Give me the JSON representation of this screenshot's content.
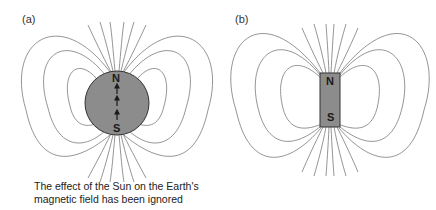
{
  "panels": [
    {
      "label": "(a)",
      "subject": "Earth",
      "north_label": "N",
      "south_label": "S",
      "shape": "circle",
      "fill_color": "#8c8c8c",
      "arrows": 3
    },
    {
      "label": "(b)",
      "subject": "bar magnet",
      "north_label": "N",
      "south_label": "S",
      "shape": "rectangle",
      "fill_color": "#8c8c8c"
    }
  ],
  "caption": {
    "line1": "The effect of the Sun on the Earth's",
    "line2": "magnetic field has been ignored"
  },
  "colors": {
    "field_lines": "#7a7a7a",
    "body": "#8c8c8c",
    "outline": "#333333"
  }
}
